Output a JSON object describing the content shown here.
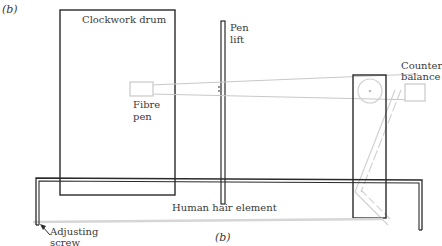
{
  "figure": {
    "panel_label": "(b)",
    "caption": "(b)"
  },
  "labels": {
    "clockwork_drum": "Clockwork drum",
    "pen_lift_line1": "Pen",
    "pen_lift_line2": "lift",
    "fibre_pen_line1": "Fibre",
    "fibre_pen_line2": "pen",
    "counter_balance_line1": "Counter",
    "counter_balance_line2": "balance",
    "human_hair_element": "Human hair element",
    "adjusting_screw_line1": "Adjusting",
    "adjusting_screw_line2": "screw"
  },
  "colors": {
    "outline": "#2a2a2a",
    "linkage": "#c8c8c8",
    "hair": "#d6d6d6"
  }
}
